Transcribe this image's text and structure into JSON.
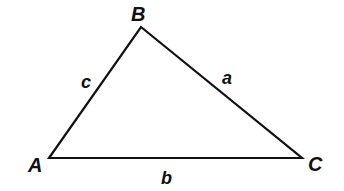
{
  "diagram": {
    "type": "triangle",
    "vertices": [
      {
        "label": "A",
        "x": 49,
        "y": 158
      },
      {
        "label": "B",
        "x": 141,
        "y": 27
      },
      {
        "label": "C",
        "x": 302,
        "y": 158
      }
    ],
    "sides": [
      {
        "label": "a",
        "between": "B-C"
      },
      {
        "label": "b",
        "between": "A-C"
      },
      {
        "label": "c",
        "between": "A-B"
      }
    ],
    "stroke_color": "#111111",
    "background": "#ffffff"
  },
  "labels": {
    "A": "A",
    "B": "B",
    "C": "C",
    "a": "a",
    "b": "b",
    "c": "c"
  }
}
